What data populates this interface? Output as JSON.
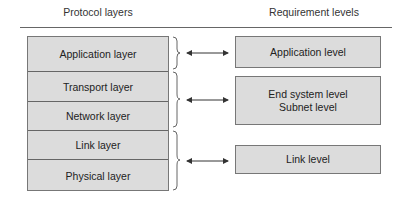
{
  "headers": {
    "left": "Protocol layers",
    "right": "Requirement levels"
  },
  "protocol_layers": [
    {
      "label": "Application layer"
    },
    {
      "label": "Transport layer"
    },
    {
      "label": "Network layer"
    },
    {
      "label": "Link layer"
    },
    {
      "label": "Physical layer"
    }
  ],
  "requirement_levels": [
    {
      "lines": [
        "Application level"
      ]
    },
    {
      "lines": [
        "End system level",
        "Subnet level"
      ]
    },
    {
      "lines": [
        "Link level"
      ]
    }
  ],
  "mappings": [
    {
      "layers": [
        "Application layer"
      ],
      "level": "Application level"
    },
    {
      "layers": [
        "Transport layer",
        "Network layer"
      ],
      "level": "End system level / Subnet level"
    },
    {
      "layers": [
        "Link layer",
        "Physical layer"
      ],
      "level": "Link level"
    }
  ],
  "colors": {
    "box_fill": "#dcdcdc",
    "box_border": "#777777",
    "line": "#333333"
  }
}
